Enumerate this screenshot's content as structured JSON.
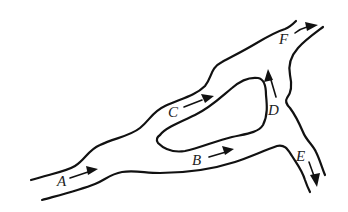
{
  "diagram": {
    "labels": {
      "A": "A",
      "B": "B",
      "C": "C",
      "D": "D",
      "E": "E",
      "F": "F"
    },
    "colors": {
      "stroke": "#111111",
      "background": "#ffffff"
    }
  }
}
